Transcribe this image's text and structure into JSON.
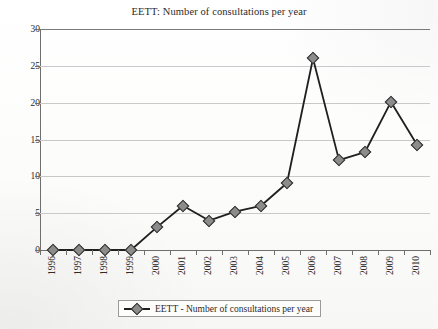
{
  "chart_data": {
    "type": "line",
    "title": "EETT: Number of consultations per year",
    "xlabel": "",
    "ylabel": "",
    "categories": [
      "1996",
      "1997",
      "1998",
      "1999",
      "2000",
      "2001",
      "2002",
      "2003",
      "2004",
      "2005",
      "2006",
      "2007",
      "2008",
      "2009",
      "2010"
    ],
    "values": [
      0,
      0,
      0,
      0,
      3.1,
      6.0,
      4.0,
      5.2,
      6.0,
      9.1,
      26.0,
      12.2,
      13.3,
      20.1,
      14.3
    ],
    "series": [
      {
        "name": "EETT - Number of consultations per year",
        "values": [
          0,
          0,
          0,
          0,
          3.1,
          6.0,
          4.0,
          5.2,
          6.0,
          9.1,
          26.0,
          12.2,
          13.3,
          20.1,
          14.3
        ]
      }
    ],
    "ylim": [
      0,
      30
    ],
    "y_ticks": [
      0,
      5,
      10,
      15,
      20,
      25,
      30
    ],
    "grid": "horizontal",
    "legend_position": "bottom-center",
    "marker": "diamond",
    "line_color": "#1f1f1f",
    "marker_fill": "#8c8c8c",
    "marker_edge": "#2a2a2a",
    "grid_color": "#c9c9c9",
    "axis_color": "#6f6f6f"
  },
  "legend": {
    "entries": [
      {
        "label": "EETT - Number of consultations per year",
        "marker": "diamond-line-marker"
      }
    ]
  }
}
